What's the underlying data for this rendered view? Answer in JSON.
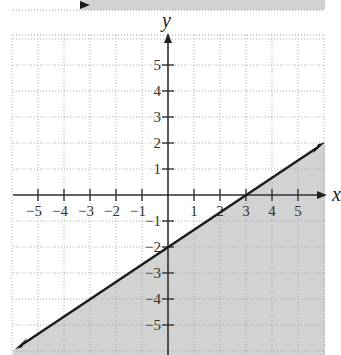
{
  "chart_data": {
    "type": "line",
    "title": "",
    "xlabel": "x",
    "ylabel": "y",
    "xlim": [
      -6,
      6
    ],
    "ylim": [
      -6,
      6
    ],
    "x_ticks": [
      "−5",
      "−4",
      "−3",
      "−2",
      "−1",
      "1",
      "2",
      "3",
      "4",
      "5"
    ],
    "y_ticks": [
      "5",
      "4",
      "3",
      "2",
      "1",
      "−1",
      "−2",
      "−3",
      "−4",
      "−5"
    ],
    "grid": true,
    "series": [
      {
        "name": "boundary line",
        "equation": "y = (2/3)x − 2",
        "x": [
          -6,
          0,
          3,
          6
        ],
        "y": [
          -6,
          -2,
          0,
          2
        ]
      }
    ],
    "shaded_region": "below the line (y ≤ (2/3)x − 2)",
    "colors": {
      "shade": "#d2d2d2",
      "line": "#1a1a1a",
      "grid": "#9a9a9a"
    }
  }
}
